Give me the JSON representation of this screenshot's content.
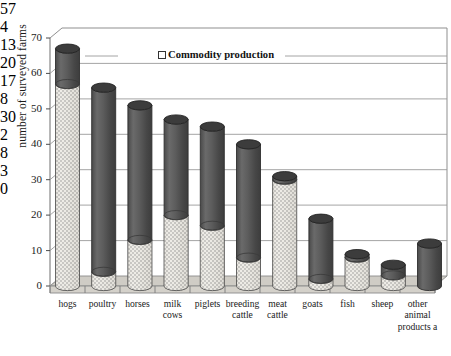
{
  "chart_data": {
    "type": "bar",
    "title": "",
    "subtitle": "",
    "xlabel": "",
    "ylabel": "number of surveyed farms",
    "ylim": [
      0,
      70
    ],
    "ytick_labels": [
      "0",
      "10",
      "20",
      "30",
      "40",
      "50",
      "60",
      "70"
    ],
    "ytick_values": [
      0,
      10,
      20,
      30,
      40,
      50,
      60,
      70
    ],
    "grid": true,
    "grid_axis": "y",
    "legend": {
      "position": "inside-top-center",
      "entries": [
        {
          "label": "Commodity production",
          "marker": "hollow-square",
          "fill": "#fefefe"
        }
      ]
    },
    "style": "3d-cylinder-stacked",
    "categories": [
      "hogs",
      "poultry",
      "horses",
      "milk cows",
      "piglets",
      "breeding cattle",
      "meat cattle",
      "goats",
      "fish",
      "sheep",
      "other animal products a"
    ],
    "category_lines": [
      [
        "hogs"
      ],
      [
        "poultry"
      ],
      [
        "horses"
      ],
      [
        "milk",
        "cows"
      ],
      [
        "piglets"
      ],
      [
        "breeding",
        "cattle"
      ],
      [
        "meat",
        "cattle"
      ],
      [
        "goats"
      ],
      [
        "fish"
      ],
      [
        "sheep"
      ],
      [
        "other",
        "animal",
        "products a"
      ]
    ],
    "series": [
      {
        "name": "Commodity production",
        "fill": "#e8e6e0",
        "pattern": "dotted-speckle",
        "values": [
          57,
          4,
          13,
          20,
          17,
          8,
          30,
          2,
          8,
          3,
          0
        ]
      },
      {
        "name": "Remainder of surveyed farms",
        "fill": "#565656",
        "pattern": "solid-dark",
        "values": [
          10,
          52,
          38,
          27,
          28,
          32,
          1,
          17,
          1,
          3,
          12
        ]
      }
    ],
    "totals": [
      67,
      56,
      51,
      47,
      45,
      40,
      31,
      19,
      9,
      6,
      12
    ],
    "value_labels": [
      "57",
      "4",
      "13",
      "20",
      "17",
      "8",
      "30",
      "2",
      "8",
      "3",
      "0"
    ],
    "colors": {
      "commodity_fill": "#e8e6e0",
      "remainder_fill": "#565656",
      "floor": "#cfcfc9",
      "backwall": "#ffffff",
      "gridline": "#8a8a8a",
      "axis": "#6f6f6f",
      "text": "#1a1a1a"
    }
  }
}
